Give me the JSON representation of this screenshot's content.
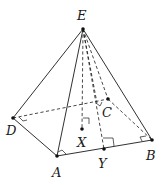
{
  "diagram": {
    "type": "square pyramid with apex E",
    "colors": {
      "line": "#1a1a1a",
      "point": "#111111",
      "background": "#ffffff"
    },
    "points": {
      "E": {
        "label": "E",
        "x": 83,
        "y": 29
      },
      "A": {
        "label": "A",
        "x": 57,
        "y": 156
      },
      "B": {
        "label": "B",
        "x": 152,
        "y": 140
      },
      "C": {
        "label": "C",
        "x": 108,
        "y": 99
      },
      "D": {
        "label": "D",
        "x": 13,
        "y": 118
      },
      "X": {
        "label": "X",
        "x": 82,
        "y": 129
      },
      "Y": {
        "label": "Y",
        "x": 104,
        "y": 149
      }
    },
    "visible_edges": [
      "EA",
      "EB",
      "ED",
      "DA",
      "AB"
    ],
    "hidden_edges": [
      "DC",
      "CB",
      "EC",
      "EX",
      "EY"
    ],
    "right_angle_marks": [
      "at D",
      "at A",
      "at B",
      "at X",
      "at Y"
    ]
  }
}
